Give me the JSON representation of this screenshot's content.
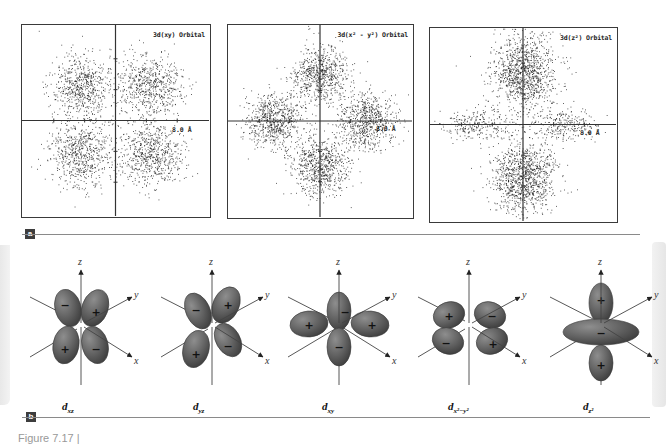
{
  "panel_a": {
    "tag": "a",
    "plots": [
      {
        "title": "3d(xy) Orbital",
        "scale_label": "8.0 Å",
        "lobes": [
          [
            -0.36,
            -0.36
          ],
          [
            0.36,
            -0.36
          ],
          [
            -0.36,
            0.36
          ],
          [
            0.36,
            0.36
          ]
        ],
        "spread": [
          0.17,
          0.17
        ],
        "satellite": []
      },
      {
        "title": "3d(x² - y²) Orbital",
        "scale_label": "8.0 Å",
        "lobes": [
          [
            0,
            -0.5
          ],
          [
            0,
            0.5
          ],
          [
            -0.5,
            0
          ],
          [
            0.5,
            0
          ]
        ],
        "spread": [
          0.15,
          0.15
        ],
        "satellite": []
      },
      {
        "title": "3d(z²) Orbital",
        "scale_label": "8.0 Å",
        "lobes": [
          [
            0,
            -0.55
          ],
          [
            0,
            0.55
          ]
        ],
        "spread": [
          0.17,
          0.2
        ],
        "satellite": [
          [
            -0.5,
            0
          ],
          [
            0.45,
            0
          ]
        ]
      }
    ]
  },
  "panel_b": {
    "tag": "b",
    "orbitals": [
      {
        "name": "d",
        "sub": "xz",
        "axes": [
          "z",
          "y",
          "x"
        ],
        "signs": [
          "−",
          "+",
          "+",
          "−"
        ]
      },
      {
        "name": "d",
        "sub": "yz",
        "axes": [
          "z",
          "y",
          "x"
        ],
        "signs": [
          "−",
          "+",
          "+",
          "−"
        ]
      },
      {
        "name": "d",
        "sub": "xy",
        "axes": [
          "z",
          "y",
          "x"
        ],
        "signs": [
          "+",
          "−",
          "+",
          "−"
        ]
      },
      {
        "name": "d",
        "sub": "x²−y²",
        "axes": [
          "z",
          "y",
          "x"
        ],
        "signs": [
          "+",
          "−",
          "−",
          "+"
        ]
      },
      {
        "name": "d",
        "sub": "z²",
        "axes": [
          "z",
          "y",
          "x"
        ],
        "signs": [
          "+",
          "−",
          "+"
        ]
      }
    ]
  },
  "caption": "Figure 7.17 |",
  "colors": {
    "lobe": "#5f5f5f",
    "lobe_light": "#8e8e8e",
    "axis": "#444444",
    "dot": "#1a1a1a"
  }
}
